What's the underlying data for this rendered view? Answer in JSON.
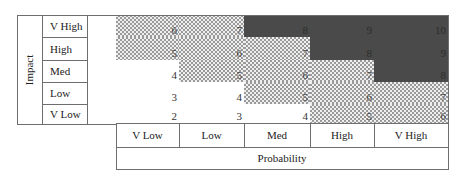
{
  "impact_axis": {
    "title": "Impact",
    "levels": [
      "V High",
      "High",
      "Med",
      "Low",
      "V Low"
    ]
  },
  "probability_axis": {
    "title": "Probability",
    "levels": [
      "V Low",
      "Low",
      "Med",
      "High",
      "V High"
    ]
  },
  "matrix": {
    "rows": [
      {
        "impact": "V High",
        "scores": [
          "6",
          "7",
          "8",
          "9",
          "10"
        ],
        "shades": [
          "dot",
          "dot",
          "dark",
          "dark",
          "dark"
        ]
      },
      {
        "impact": "High",
        "scores": [
          "5",
          "6",
          "7",
          "8",
          "9"
        ],
        "shades": [
          "dot",
          "dot",
          "dot",
          "dark",
          "dark"
        ]
      },
      {
        "impact": "Med",
        "scores": [
          "4",
          "5",
          "6",
          "7",
          "8"
        ],
        "shades": [
          "white",
          "dot",
          "dot",
          "dot",
          "dark"
        ]
      },
      {
        "impact": "Low",
        "scores": [
          "3",
          "4",
          "5",
          "6",
          "7"
        ],
        "shades": [
          "white",
          "white",
          "dot",
          "dot",
          "dot"
        ]
      },
      {
        "impact": "V Low",
        "scores": [
          "2",
          "3",
          "4",
          "5",
          "6"
        ],
        "shades": [
          "white",
          "white",
          "white",
          "dot",
          "dot"
        ]
      }
    ]
  },
  "legend_colors": {
    "low": "#ffffff",
    "medium_dotted": "#9a9a9a",
    "high_dark": "#4a4a4a"
  }
}
